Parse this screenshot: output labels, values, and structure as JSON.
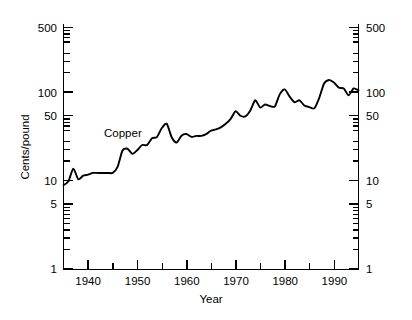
{
  "chart_data": {
    "type": "line",
    "title": "",
    "subtitle": "",
    "xlabel": "Year",
    "ylabel": "Cents/pound",
    "yscale": "log",
    "xscale": "linear",
    "xlim": [
      1935,
      1995
    ],
    "ylim": [
      1,
      1000
    ],
    "grid": false,
    "legend_position": "inline-annotation",
    "annotations": [
      {
        "text": "Copper",
        "x": 1947.5,
        "y": 30
      }
    ],
    "y_ticks_major": [
      1,
      5,
      10,
      50,
      100,
      500
    ],
    "y_tick_labels": [
      "1",
      "5",
      "10",
      "50",
      "100",
      "500"
    ],
    "y_ticks_minor": [
      2,
      3,
      4,
      6,
      7,
      8,
      9,
      20,
      30,
      40,
      60,
      70,
      80,
      90,
      200,
      300,
      400,
      600,
      700,
      800,
      900
    ],
    "x_ticks_major": [
      1940,
      1950,
      1960,
      1970,
      1980,
      1990
    ],
    "x_tick_labels": [
      "1940",
      "1950",
      "1960",
      "1970",
      "1980",
      "1990"
    ],
    "x_ticks_minor": [
      1935,
      1945,
      1955,
      1965,
      1975,
      1985,
      1995
    ],
    "right_axis_mirrored": true,
    "series": [
      {
        "name": "Copper",
        "color": "#000000",
        "x": [
          1935,
          1936,
          1937,
          1938,
          1939,
          1940,
          1941,
          1942,
          1943,
          1944,
          1945,
          1946,
          1947,
          1948,
          1949,
          1950,
          1951,
          1952,
          1953,
          1954,
          1955,
          1956,
          1957,
          1958,
          1959,
          1960,
          1961,
          1962,
          1963,
          1964,
          1965,
          1966,
          1967,
          1968,
          1969,
          1970,
          1971,
          1972,
          1973,
          1974,
          1975,
          1976,
          1977,
          1978,
          1979,
          1980,
          1981,
          1982,
          1983,
          1984,
          1985,
          1986,
          1987,
          1988,
          1989,
          1990,
          1991,
          1992,
          1993,
          1994,
          1995
        ],
        "values": [
          8.6,
          9.5,
          13.2,
          10.0,
          11.0,
          11.3,
          11.8,
          11.8,
          11.8,
          11.8,
          11.8,
          13.8,
          21.0,
          22.0,
          19.3,
          21.2,
          24.2,
          24.2,
          28.8,
          29.7,
          37.5,
          41.8,
          29.6,
          25.8,
          30.8,
          32.1,
          29.9,
          30.6,
          30.6,
          32.0,
          35.0,
          36.2,
          38.2,
          41.8,
          47.5,
          57.7,
          51.4,
          50.6,
          58.8,
          76.6,
          63.5,
          68.8,
          65.8,
          65.5,
          89.8,
          101.4,
          84.2,
          72.8,
          76.5,
          66.8,
          64.3,
          62.1,
          81.0,
          117.9,
          129.1,
          120.8,
          106.1,
          103.6,
          87.0,
          104.0,
          99.0
        ]
      }
    ]
  },
  "axes": {
    "y_left_label": "Cents/pound",
    "y_right_label": "",
    "x_label": "Year"
  }
}
